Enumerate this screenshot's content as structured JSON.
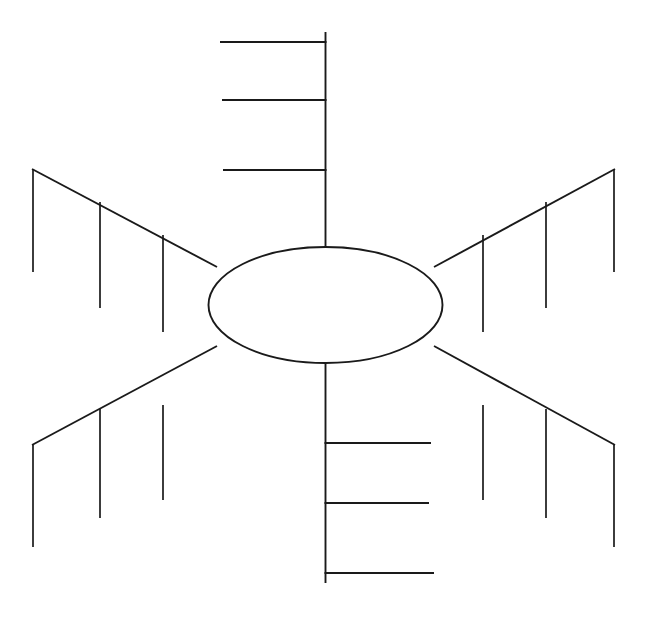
{
  "document": {
    "type": "fishbone-ishikawa-diagram",
    "title_clipped": "Figure 1  Fishbone (Ishikawa) diagram",
    "background_color": "#ffffff",
    "line_color": "#1a1a1a",
    "width": 646,
    "height": 617
  },
  "head": {
    "label": "",
    "shape": "ellipse",
    "center_x": 325.5,
    "center_y": 305,
    "radius_x": 117,
    "radius_y": 58,
    "fill": "#ffffff",
    "stroke": "#1a1a1a"
  },
  "spine": {
    "top_segment": {
      "x": 325.5,
      "y1": 32,
      "y2": 247,
      "label": ""
    },
    "bottom_segment": {
      "x": 325.5,
      "y1": 363,
      "y2": 583,
      "label": ""
    }
  },
  "branches": [
    {
      "id": "top-spine-ribs",
      "name": "top-vertical-ribs",
      "orientation": "top-horizontal-left",
      "label": "",
      "ribs": [
        {
          "label": "",
          "y": 42,
          "x_start": 220,
          "x_end": 326
        },
        {
          "label": "",
          "y": 100,
          "x_start": 222,
          "x_end": 326
        },
        {
          "label": "",
          "y": 170,
          "x_start": 223,
          "x_end": 326
        }
      ]
    },
    {
      "id": "bottom-spine-ribs",
      "name": "bottom-vertical-ribs",
      "orientation": "bottom-horizontal-right",
      "label": "",
      "ribs": [
        {
          "label": "",
          "y": 443,
          "x_start": 325,
          "x_end": 431
        },
        {
          "label": "",
          "y": 503,
          "x_start": 325,
          "x_end": 429
        },
        {
          "label": "",
          "y": 573,
          "x_start": 325,
          "x_end": 434
        }
      ]
    },
    {
      "id": "upper-left",
      "name": "upper-left-branch",
      "label": "",
      "spine": {
        "x1": 33,
        "y1": 170,
        "x2": 216,
        "y2": 266
      },
      "ribs": [
        {
          "label": "",
          "x": 33,
          "y1": 170,
          "y2": 272
        },
        {
          "label": "",
          "x": 100,
          "y1": 202,
          "y2": 308
        },
        {
          "label": "",
          "x": 163,
          "y1": 235,
          "y2": 332
        }
      ]
    },
    {
      "id": "upper-right",
      "name": "upper-right-branch",
      "label": "",
      "spine": {
        "x1": 614,
        "y1": 170,
        "x2": 435,
        "y2": 266
      },
      "ribs": [
        {
          "label": "",
          "x": 614,
          "y1": 170,
          "y2": 272
        },
        {
          "label": "",
          "x": 546,
          "y1": 202,
          "y2": 308
        },
        {
          "label": "",
          "x": 483,
          "y1": 235,
          "y2": 332
        }
      ]
    },
    {
      "id": "lower-left",
      "name": "lower-left-branch",
      "label": "",
      "spine": {
        "x1": 33,
        "y1": 444,
        "x2": 216,
        "y2": 348
      },
      "ribs": [
        {
          "label": "",
          "x": 33,
          "y1": 444,
          "y2": 546
        },
        {
          "label": "",
          "x": 100,
          "y1": 410,
          "y2": 518
        },
        {
          "label": "",
          "x": 163,
          "y1": 406,
          "y2": 500
        }
      ]
    },
    {
      "id": "lower-right",
      "name": "lower-right-branch",
      "label": "",
      "spine": {
        "x1": 614,
        "y1": 444,
        "x2": 435,
        "y2": 348
      },
      "ribs": [
        {
          "label": "",
          "x": 614,
          "y1": 444,
          "y2": 546
        },
        {
          "label": "",
          "x": 546,
          "y1": 410,
          "y2": 518
        },
        {
          "label": "",
          "x": 483,
          "y1": 406,
          "y2": 500
        }
      ]
    }
  ]
}
